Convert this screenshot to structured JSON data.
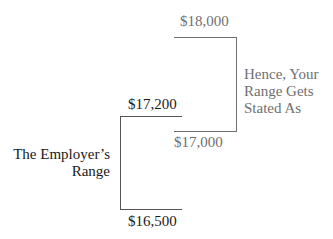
{
  "diagram": {
    "employer_range": {
      "label_line1": "The Employer’s",
      "label_line2": "Range",
      "high": "$17,200",
      "low": "$16,500",
      "color": "#1a1a1a"
    },
    "your_range": {
      "label_line1": "Hence, Your",
      "label_line2": "Range Gets",
      "label_line3": "Stated As",
      "high": "$18,000",
      "low": "$17,000",
      "color": "#6f6f6f"
    }
  }
}
